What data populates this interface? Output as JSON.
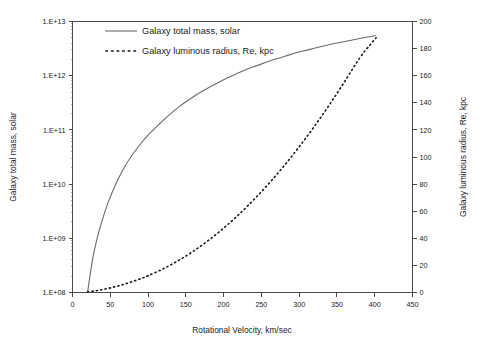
{
  "chart_data": {
    "type": "line",
    "title": "",
    "xlabel": "Rotational Velocity, km/sec",
    "ylabel": "Galaxy total mass, solar",
    "y2label": "Galaxy luminous radius, Re, kpc",
    "xlim": [
      0,
      450
    ],
    "xticks": [
      0,
      50,
      100,
      150,
      200,
      250,
      300,
      350,
      400,
      450
    ],
    "xticklabels": [
      "0",
      "50",
      "100",
      "150",
      "200",
      "250",
      "300",
      "350",
      "400",
      "450"
    ],
    "yscale": "log",
    "ylim": [
      100000000,
      10000000000000
    ],
    "yticks": [
      100000000,
      1000000000,
      10000000000,
      100000000000,
      1000000000000,
      10000000000000
    ],
    "yticklabels": [
      "1.E+08",
      "1.E+09",
      "1.E+10",
      "1.E+11",
      "1.E+12",
      "1.E+13"
    ],
    "y2lim": [
      0,
      200
    ],
    "y2ticks": [
      0,
      20,
      40,
      60,
      80,
      100,
      120,
      140,
      160,
      180,
      200
    ],
    "y2ticklabels": [
      "0",
      "20",
      "40",
      "60",
      "80",
      "100",
      "120",
      "140",
      "160",
      "180",
      "200"
    ],
    "grid": false,
    "legend_position": "upper-left-inside",
    "series": [
      {
        "name": "Galaxy total mass, solar",
        "axis": "left",
        "style": "solid",
        "color": "#6b6b6b",
        "x": [
          20,
          22,
          25,
          28,
          32,
          36,
          40,
          45,
          50,
          60,
          70,
          80,
          90,
          100,
          110,
          120,
          130,
          140,
          150,
          160,
          170,
          180,
          190,
          200,
          215,
          230,
          245,
          260,
          275,
          290,
          305,
          320,
          335,
          350,
          365,
          380,
          395,
          402
        ],
        "y": [
          100000000,
          160000000,
          300000000,
          520000000,
          920000000.0,
          1500000000.0,
          2300000000.0,
          3800000000.0,
          5800000000.0,
          12000000000.0,
          22000000000.0,
          36000000000.0,
          55000000000.0,
          80000000000.0,
          110000000000.0,
          150000000000.0,
          200000000000.0,
          260000000000.0,
          330000000000.0,
          410000000000.0,
          500000000000.0,
          600000000000.0,
          710000000000.0,
          840000000000.0,
          1050000000000.0,
          1300000000000.0,
          1550000000000.0,
          1850000000000.0,
          2150000000000.0,
          2500000000000.0,
          2850000000000.0,
          3200000000000.0,
          3600000000000.0,
          4000000000000.0,
          4400000000000.0,
          4850000000000.0,
          5300000000000.0,
          5500000000000.0
        ]
      },
      {
        "name": "Galaxy luminous radius, Re, kpc",
        "axis": "right",
        "style": "dotted",
        "color": "#171717",
        "x": [
          20,
          30,
          40,
          50,
          60,
          70,
          80,
          90,
          100,
          120,
          140,
          160,
          180,
          200,
          220,
          240,
          260,
          280,
          300,
          320,
          340,
          360,
          380,
          395,
          402
        ],
        "y": [
          0.5,
          1.2,
          2.2,
          3.4,
          4.8,
          6.4,
          8.2,
          10.2,
          12.4,
          17.5,
          23.5,
          30.5,
          38.5,
          47.5,
          57.5,
          68.5,
          80.5,
          93.5,
          107.5,
          122.5,
          138.5,
          155.5,
          173.0,
          183.5,
          188.0
        ]
      }
    ],
    "legend": [
      {
        "label": "Galaxy total mass, solar",
        "style": "solid",
        "color": "#6b6b6b"
      },
      {
        "label": "Galaxy luminous radius, Re, kpc",
        "style": "dotted",
        "color": "#171717"
      }
    ]
  }
}
